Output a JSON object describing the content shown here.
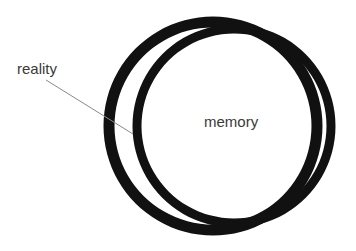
{
  "figure": {
    "type": "venn-diagram",
    "title": "",
    "background_color": "#ffffff",
    "ink_color": "#111111",
    "text_color": "#3a3a3a",
    "leader_color": "#8a8a8a"
  },
  "labels": {
    "reality": "reality",
    "memory": "memory"
  },
  "chart_data": {
    "type": "diagram",
    "subtype": "two-overlapping-rings",
    "title": "",
    "legend": [
      "reality",
      "memory"
    ],
    "sets": [
      {
        "name": "reality",
        "label": "reality",
        "label_x": 17,
        "label_y": 74,
        "cx": 213,
        "cy": 126,
        "r": 104,
        "stroke_width": 11,
        "leader_line": {
          "x1": 46,
          "y1": 80,
          "x2": 133,
          "y2": 134
        }
      },
      {
        "name": "memory",
        "label": "memory",
        "label_x": 204,
        "label_y": 127,
        "cx": 234,
        "cy": 126,
        "r": 97,
        "stroke_width": 9,
        "leader_line": null
      }
    ],
    "fill_rule": "evenodd"
  }
}
